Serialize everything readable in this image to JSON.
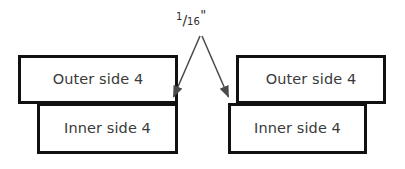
{
  "diagram": {
    "background_color": "#ffffff",
    "box_border_color": "#111111",
    "text_color": "#3a3a3a",
    "arrow_color": "#4a4a4a",
    "annotation": {
      "name": "gap-dimension",
      "numerator": "1",
      "slash": "/",
      "denominator": "16",
      "unit_mark": "\"",
      "full_text": "1/16\""
    },
    "boxes": [
      {
        "id": "outer-left",
        "label": "Outer side 4",
        "group": "left",
        "position": "outer"
      },
      {
        "id": "inner-left",
        "label": "Inner side 4",
        "group": "left",
        "position": "inner"
      },
      {
        "id": "outer-right",
        "label": "Outer side 4",
        "group": "right",
        "position": "outer"
      },
      {
        "id": "inner-right",
        "label": "Inner side 4",
        "group": "right",
        "position": "inner"
      }
    ],
    "arrows": [
      {
        "id": "arrow-left",
        "from": [
          200,
          36
        ],
        "to": [
          172,
          100
        ],
        "head": "end"
      },
      {
        "id": "arrow-right",
        "from": [
          202,
          36
        ],
        "to": [
          230,
          100
        ],
        "head": "end"
      }
    ]
  }
}
